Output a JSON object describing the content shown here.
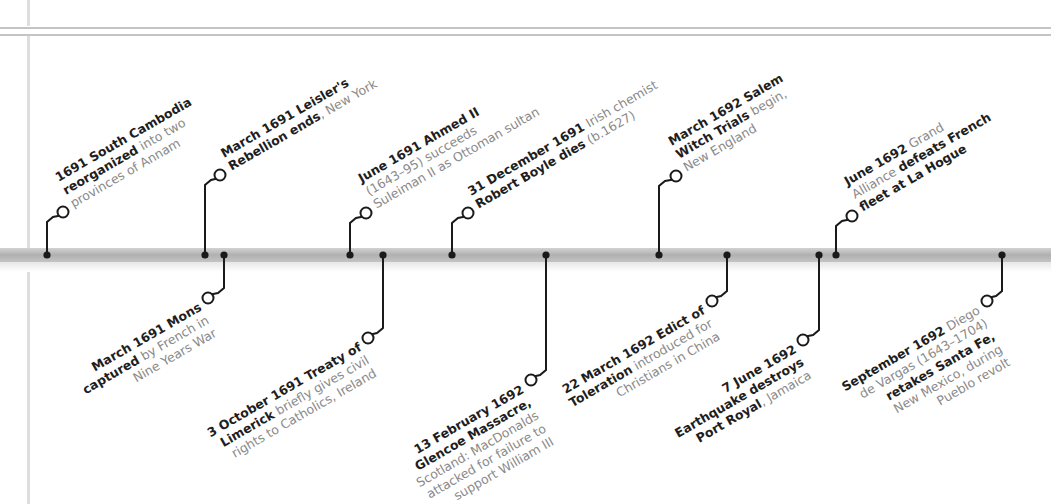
{
  "timeline": {
    "axis_color": "#b8b8b8",
    "marker_color": "#1a1a1a",
    "events_above": [
      {
        "id": "south-cambodia",
        "dot_x": 47,
        "circle": [
          63,
          212
        ],
        "lines": [
          [
            {
              "b": "1691 South Cambodia"
            }
          ],
          [
            {
              "b": "reorganized"
            },
            {
              "t": " into two"
            }
          ],
          [
            {
              "t": "provinces of Annam"
            }
          ]
        ],
        "label_pos": [
          73,
          207
        ]
      },
      {
        "id": "leisler",
        "dot_x": 205,
        "circle": [
          220,
          175
        ],
        "lines": [
          [
            {
              "b": "March 1691 Leisler's"
            }
          ],
          [
            {
              "b": "Rebellion ends"
            },
            {
              "t": ", New York"
            }
          ]
        ],
        "label_pos": [
          231,
          170
        ]
      },
      {
        "id": "ahmed-ii",
        "dot_x": 350,
        "circle": [
          366,
          213
        ],
        "lines": [
          [
            {
              "b": "June 1691 Ahmed II"
            }
          ],
          [
            {
              "t": "(1643–95) succeeds"
            }
          ],
          [
            {
              "t": "Suleiman II as Ottoman sultan"
            }
          ]
        ],
        "label_pos": [
          376,
          208
        ]
      },
      {
        "id": "boyle",
        "dot_x": 452,
        "circle": [
          468,
          213
        ],
        "lines": [
          [
            {
              "b": "31 December 1691"
            },
            {
              "t": " Irish chemist"
            }
          ],
          [
            {
              "b": "Robert Boyle dies"
            },
            {
              "t": " (b.1627)"
            }
          ]
        ],
        "label_pos": [
          478,
          208
        ]
      },
      {
        "id": "salem",
        "dot_x": 659,
        "circle": [
          676,
          176
        ],
        "lines": [
          [
            {
              "b": "March 1692 Salem"
            }
          ],
          [
            {
              "b": "Witch Trials"
            },
            {
              "t": " begin,"
            }
          ],
          [
            {
              "t": "New England"
            }
          ]
        ],
        "label_pos": [
          686,
          171
        ]
      },
      {
        "id": "la-hogue",
        "dot_x": 836,
        "circle": [
          852,
          216
        ],
        "lines": [
          [
            {
              "b": "June 1692"
            },
            {
              "t": " Grand"
            }
          ],
          [
            {
              "t": "Alliance "
            },
            {
              "b": "defeats French"
            }
          ],
          [
            {
              "b": "fleet at La Hogue"
            }
          ]
        ],
        "label_pos": [
          862,
          211
        ]
      }
    ],
    "events_below": [
      {
        "id": "mons",
        "dot_x": 224,
        "circle": [
          208,
          298
        ],
        "lines": [
          [
            {
              "b": "March 1691 Mons"
            }
          ],
          [
            {
              "b": "captured"
            },
            {
              "t": " by French in"
            }
          ],
          [
            {
              "t": "Nine Years War"
            }
          ]
        ],
        "label_pos": [
          198,
          303
        ]
      },
      {
        "id": "limerick",
        "dot_x": 383,
        "circle": [
          368,
          338
        ],
        "lines": [
          [
            {
              "b": "3 October 1691 Treaty of"
            }
          ],
          [
            {
              "b": "Limerick"
            },
            {
              "t": " briefly gives civil"
            }
          ],
          [
            {
              "t": "rights to Catholics, Ireland"
            }
          ]
        ],
        "label_pos": [
          358,
          343
        ]
      },
      {
        "id": "glencoe",
        "dot_x": 546,
        "circle": [
          531,
          380
        ],
        "lines": [
          [
            {
              "b": "13 February 1692"
            }
          ],
          [
            {
              "b": "Glencoe Massacre,"
            }
          ],
          [
            {
              "t": "Scotland: MacDonalds"
            }
          ],
          [
            {
              "t": "attacked for failure to"
            }
          ],
          [
            {
              "t": "support William III"
            }
          ]
        ],
        "label_pos": [
          521,
          385
        ]
      },
      {
        "id": "edict-toleration",
        "dot_x": 727,
        "circle": [
          712,
          301
        ],
        "lines": [
          [
            {
              "b": "22 March 1692 Edict of"
            }
          ],
          [
            {
              "b": "Toleration"
            },
            {
              "t": " introduced for"
            }
          ],
          [
            {
              "t": "Christians in China"
            }
          ]
        ],
        "label_pos": [
          702,
          306
        ]
      },
      {
        "id": "port-royal",
        "dot_x": 819,
        "circle": [
          803,
          340
        ],
        "lines": [
          [
            {
              "b": "7 June 1692"
            }
          ],
          [
            {
              "b": "Earthquake destroys"
            }
          ],
          [
            {
              "b": "Port Royal"
            },
            {
              "t": ", Jamaica"
            }
          ]
        ],
        "label_pos": [
          793,
          345
        ]
      },
      {
        "id": "santa-fe",
        "dot_x": 1002,
        "circle": [
          987,
          301
        ],
        "lines": [
          [
            {
              "b": "September 1692"
            },
            {
              "t": " Diego"
            }
          ],
          [
            {
              "t": "de Vargas (1643–1704)"
            }
          ],
          [
            {
              "b": "retakes Santa Fe,"
            }
          ],
          [
            {
              "t": "New Mexico, during"
            }
          ],
          [
            {
              "t": "Pueblo revolt"
            }
          ]
        ],
        "label_pos": [
          977,
          306
        ]
      }
    ]
  }
}
